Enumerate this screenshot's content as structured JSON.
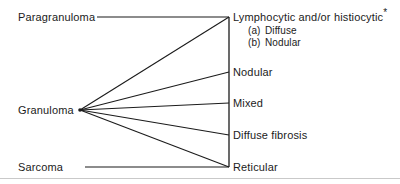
{
  "figure": {
    "type": "classification-tree",
    "background_color": "#ffffff",
    "line_color": "#1b1b1b",
    "text_color": "#1b1b1b",
    "width": 400,
    "height": 184
  },
  "left_nodes": [
    {
      "id": "paragranuloma",
      "label": "Paragranuloma",
      "x": 18,
      "y": 17
    },
    {
      "id": "granuloma",
      "label": "Granuloma",
      "x": 18,
      "y": 110
    },
    {
      "id": "sarcoma",
      "label": "Sarcoma",
      "x": 18,
      "y": 167
    }
  ],
  "right_nodes": [
    {
      "id": "lymphocytic-histiocytic",
      "label": "Lymphocytic and/or histiocytic",
      "marker": "*",
      "y": 17
    },
    {
      "id": "nodular",
      "label": "Nodular",
      "marker": "",
      "y": 72
    },
    {
      "id": "mixed",
      "label": "Mixed",
      "marker": "",
      "y": 103
    },
    {
      "id": "diffuse-fibrosis",
      "label": "Diffuse fibrosis",
      "marker": "",
      "y": 135
    },
    {
      "id": "reticular",
      "label": "Reticular",
      "marker": "",
      "y": 167
    }
  ],
  "sub_items": [
    {
      "id": "sub-a-diffuse",
      "marker": "(a)",
      "label": "Diffuse",
      "y": 30
    },
    {
      "id": "sub-b-nodular",
      "marker": "(b)",
      "label": "Nodular",
      "y": 42
    }
  ],
  "geometry": {
    "hub_x": 80,
    "hub_y": 110,
    "bracket_x": 229,
    "bracket_top": 17,
    "bracket_bottom": 167,
    "paragranuloma_line_start_x": 97,
    "sarcoma_line_start_x": 85,
    "right_label_x": 233,
    "sub_label_x": 248,
    "bottom_rule_y": 178
  },
  "connectors": [
    {
      "id": "connector-paragranuloma-lymphocytic",
      "from": "paragranuloma",
      "to": "lymphocytic-histiocytic",
      "kind": "horizontal"
    },
    {
      "id": "connector-granuloma-lymphocytic",
      "from": "granuloma",
      "to": "lymphocytic-histiocytic",
      "kind": "fan"
    },
    {
      "id": "connector-granuloma-nodular",
      "from": "granuloma",
      "to": "nodular",
      "kind": "fan"
    },
    {
      "id": "connector-granuloma-mixed",
      "from": "granuloma",
      "to": "mixed",
      "kind": "fan"
    },
    {
      "id": "connector-granuloma-diffuse-fibrosis",
      "from": "granuloma",
      "to": "diffuse-fibrosis",
      "kind": "fan"
    },
    {
      "id": "connector-granuloma-reticular",
      "from": "granuloma",
      "to": "reticular",
      "kind": "fan"
    },
    {
      "id": "connector-sarcoma-reticular",
      "from": "sarcoma",
      "to": "reticular",
      "kind": "horizontal"
    }
  ]
}
